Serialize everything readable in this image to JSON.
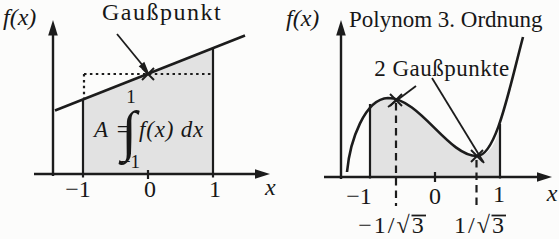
{
  "colors": {
    "background": "#fcfcfb",
    "shade": "#e2e2e2",
    "ink": "#1c1c1c"
  },
  "figure": {
    "left": {
      "y_axis_label": "f(x)",
      "x_axis_label": "x",
      "annotation": "Gaußpunkt",
      "formula": {
        "lhs": "A",
        "equals": "=",
        "integral_sign": "∫",
        "upper_limit": "1",
        "lower_limit": "−1",
        "integrand": "f(x) dx"
      },
      "ticks": {
        "minus_one": "−1",
        "zero": "0",
        "one": "1"
      }
    },
    "right": {
      "y_axis_label": "f(x)",
      "x_axis_label": "x",
      "title": "Polynom 3. Ordnung",
      "annotation": "2 Gaußpunkte",
      "ticks": {
        "minus_one": "−1",
        "zero": "0",
        "one": "1"
      },
      "gauss_points": [
        {
          "prefix": "−1/√",
          "radicand": "3"
        },
        {
          "prefix": "1/√",
          "radicand": "3"
        }
      ]
    }
  }
}
